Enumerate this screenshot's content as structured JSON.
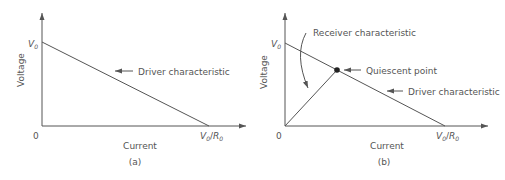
{
  "colors": {
    "line": "#555555",
    "text": "#555555",
    "background": "#ffffff"
  },
  "panel_a": {
    "caption": "(a)",
    "y_axis_label": "Voltage",
    "x_axis_label": "Current",
    "origin_label": "0",
    "y_intercept_label": "V",
    "y_intercept_sub": "0",
    "x_intercept_label_v": "V",
    "x_intercept_label_v_sub": "0",
    "x_intercept_label_slash": "/",
    "x_intercept_label_r": "R",
    "x_intercept_label_r_sub": "0",
    "annotation_driver": "Driver characteristic"
  },
  "panel_b": {
    "caption": "(b)",
    "y_axis_label": "Voltage",
    "x_axis_label": "Current",
    "origin_label": "0",
    "y_intercept_label": "V",
    "y_intercept_sub": "0",
    "x_intercept_label_v": "V",
    "x_intercept_label_v_sub": "0",
    "x_intercept_label_slash": "/",
    "x_intercept_label_r": "R",
    "x_intercept_label_r_sub": "0",
    "annotation_receiver": "Receiver characteristic",
    "annotation_quiescent": "Quiescent point",
    "annotation_driver": "Driver characteristic"
  }
}
